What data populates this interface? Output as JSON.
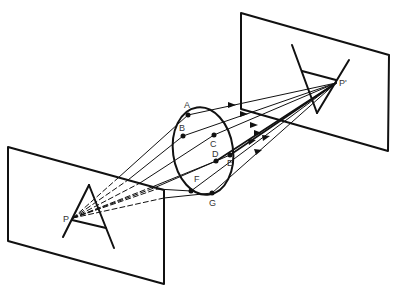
{
  "diagram": {
    "object_point_label": "P",
    "image_point_label": "P'",
    "lens_points": [
      {
        "id": "A",
        "label": "A"
      },
      {
        "id": "B",
        "label": "B"
      },
      {
        "id": "C",
        "label": "C"
      },
      {
        "id": "D",
        "label": "D"
      },
      {
        "id": "E",
        "label": "E"
      },
      {
        "id": "F",
        "label": "F"
      },
      {
        "id": "G",
        "label": "G"
      }
    ],
    "colors": {
      "line": "#111111",
      "label": "#333333",
      "background": "#ffffff"
    }
  }
}
